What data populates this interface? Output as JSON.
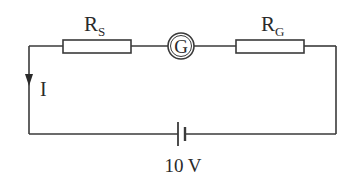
{
  "diagram": {
    "type": "series circuit",
    "components": {
      "series_resistor": {
        "symbol": "R",
        "subscript": "S"
      },
      "galvanometer": {
        "symbol": "G"
      },
      "galvanometer_resistance": {
        "symbol": "R",
        "subscript": "G"
      },
      "battery": {
        "label": "10 V"
      }
    },
    "current": {
      "label": "I",
      "direction": "down"
    }
  }
}
